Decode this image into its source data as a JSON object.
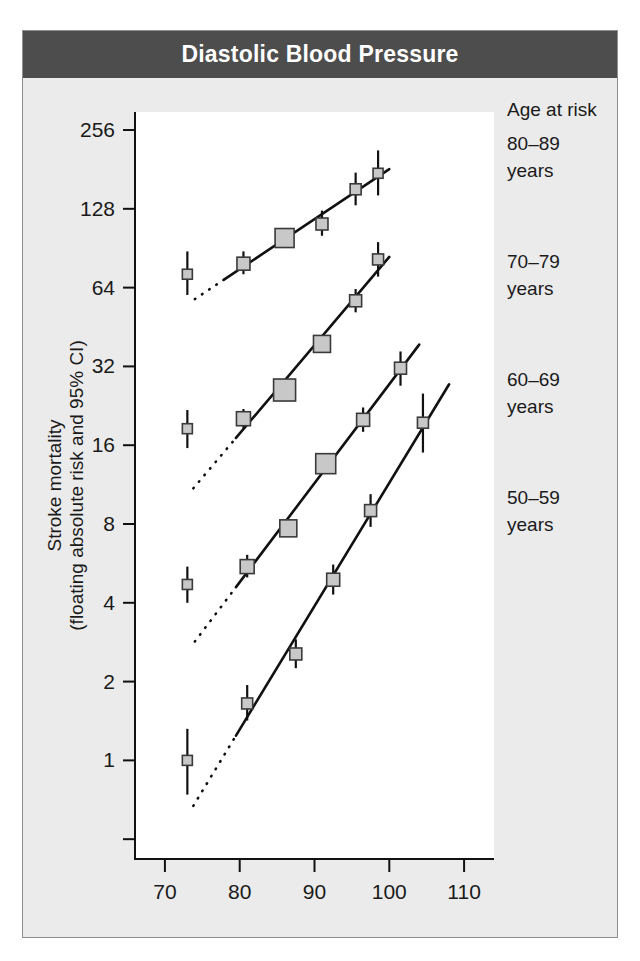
{
  "figure": {
    "panel_label": "B",
    "title": "Diastolic Blood Pressure",
    "title_bar_color": "#4d4d4d",
    "background_color": "#ebebeb",
    "plot_background_color": "#ffffff",
    "marker_fill_color": "#c8c8c8",
    "line_color": "#111111"
  },
  "legend": {
    "heading": "Age at risk",
    "entries": [
      {
        "label_line1": "80–89",
        "label_line2": "years"
      },
      {
        "label_line1": "70–79",
        "label_line2": "years"
      },
      {
        "label_line1": "60–69",
        "label_line2": "years"
      },
      {
        "label_line1": "50–59",
        "label_line2": "years"
      }
    ]
  },
  "chart_data": {
    "type": "scatter",
    "title": "Diastolic Blood Pressure",
    "xlabel": "Usual diastolic blood pressure (mm Hg)",
    "ylabel": "Stroke mortality (floating absolute risk and 95% CI)",
    "ylabel_line1": "Stroke mortality",
    "ylabel_line2": "(floating absolute risk and 95% CI)",
    "xlabel_line1": "Usual diastolic blood",
    "xlabel_line2": "pressure (mm Hg)",
    "xscale": "linear",
    "yscale": "log2",
    "xlim": [
      66,
      114
    ],
    "ylim": [
      0.42,
      300
    ],
    "xticks": [
      70,
      80,
      90,
      100,
      110
    ],
    "xtick_labels": [
      "70",
      "80",
      "90",
      "100",
      "110"
    ],
    "yticks": [
      0.5,
      1,
      2,
      4,
      8,
      16,
      32,
      64,
      128,
      256
    ],
    "ytick_labels": [
      "",
      "1",
      "2",
      "4",
      "8",
      "16",
      "32",
      "64",
      "128",
      "256"
    ],
    "grid": false,
    "legend_position": "right",
    "series": [
      {
        "name": "80–89 years",
        "points": [
          {
            "x": 73.0,
            "y": 72,
            "ci_low": 60,
            "ci_high": 88,
            "size": 10
          },
          {
            "x": 80.5,
            "y": 79,
            "ci_low": 72,
            "ci_high": 88,
            "size": 13
          },
          {
            "x": 86.0,
            "y": 99,
            "ci_low": 91,
            "ci_high": 108,
            "size": 19
          },
          {
            "x": 91.0,
            "y": 112,
            "ci_low": 101,
            "ci_high": 126,
            "size": 12
          },
          {
            "x": 95.5,
            "y": 152,
            "ci_low": 132,
            "ci_high": 176,
            "size": 11
          },
          {
            "x": 98.5,
            "y": 175,
            "ci_low": 144,
            "ci_high": 214,
            "size": 10
          }
        ],
        "fit_x": [
          78.0,
          100.0
        ],
        "dotted_x": [
          74.0,
          78.0
        ]
      },
      {
        "name": "70–79 years",
        "points": [
          {
            "x": 73.0,
            "y": 18.5,
            "ci_low": 15.6,
            "ci_high": 21.8,
            "size": 10
          },
          {
            "x": 80.5,
            "y": 20.2,
            "ci_low": 18.6,
            "ci_high": 22.0,
            "size": 14
          },
          {
            "x": 86.0,
            "y": 26.0,
            "ci_low": 24.4,
            "ci_high": 27.8,
            "size": 22
          },
          {
            "x": 91.0,
            "y": 39.0,
            "ci_low": 36.2,
            "ci_high": 42.1,
            "size": 17
          },
          {
            "x": 95.5,
            "y": 57.0,
            "ci_low": 51.5,
            "ci_high": 63.2,
            "size": 12
          },
          {
            "x": 98.5,
            "y": 82.0,
            "ci_low": 70.5,
            "ci_high": 95.5,
            "size": 11
          }
        ],
        "fit_x": [
          79.5,
          100.0
        ],
        "dotted_x": [
          73.8,
          79.5
        ]
      },
      {
        "name": "60–69 years",
        "points": [
          {
            "x": 73.0,
            "y": 4.7,
            "ci_low": 4.0,
            "ci_high": 5.5,
            "size": 10
          },
          {
            "x": 81.0,
            "y": 5.5,
            "ci_low": 5.0,
            "ci_high": 6.1,
            "size": 14
          },
          {
            "x": 86.5,
            "y": 7.7,
            "ci_low": 7.2,
            "ci_high": 8.3,
            "size": 17
          },
          {
            "x": 91.5,
            "y": 13.6,
            "ci_low": 12.6,
            "ci_high": 14.7,
            "size": 20
          },
          {
            "x": 96.5,
            "y": 20.0,
            "ci_low": 18.0,
            "ci_high": 22.3,
            "size": 13
          },
          {
            "x": 101.5,
            "y": 31.5,
            "ci_low": 27.0,
            "ci_high": 36.5,
            "size": 12
          }
        ],
        "fit_x": [
          79.5,
          104.0
        ],
        "dotted_x": [
          74.0,
          79.5
        ]
      },
      {
        "name": "50–59 years",
        "points": [
          {
            "x": 73.0,
            "y": 1.0,
            "ci_low": 0.74,
            "ci_high": 1.32,
            "size": 10
          },
          {
            "x": 81.0,
            "y": 1.65,
            "ci_low": 1.42,
            "ci_high": 1.94,
            "size": 11
          },
          {
            "x": 87.5,
            "y": 2.55,
            "ci_low": 2.25,
            "ci_high": 2.9,
            "size": 12
          },
          {
            "x": 92.5,
            "y": 4.9,
            "ci_low": 4.3,
            "ci_high": 5.6,
            "size": 13
          },
          {
            "x": 97.5,
            "y": 9.0,
            "ci_low": 7.8,
            "ci_high": 10.4,
            "size": 12
          },
          {
            "x": 104.5,
            "y": 19.5,
            "ci_low": 15.0,
            "ci_high": 25.2,
            "size": 11
          }
        ],
        "fit_x": [
          79.5,
          108.0
        ],
        "dotted_x": [
          73.8,
          79.5
        ]
      }
    ]
  }
}
